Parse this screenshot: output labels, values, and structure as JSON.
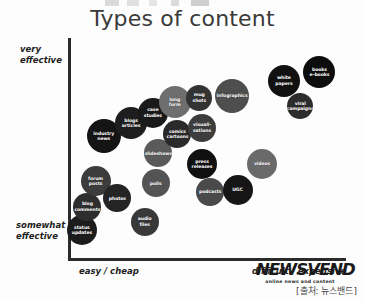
{
  "chart_data": {
    "type": "scatter",
    "title": "Types of content",
    "xlabel": "",
    "ylabel": "",
    "grid": false,
    "legend": "none",
    "axes": {
      "y_top_label": "very\neffective",
      "y_bottom_label": "somewhat\neffective",
      "x_left_label": "easy / cheap",
      "x_right_label": "difficult / expensive",
      "xlim": [
        0,
        100
      ],
      "ylim": [
        0,
        100
      ]
    },
    "points": [
      {
        "label": "status\nupdates",
        "x": 4,
        "y": 12,
        "size": 30,
        "color": "#1c1c1c"
      },
      {
        "label": "blog\ncomments",
        "x": 6,
        "y": 23,
        "size": 28,
        "color": "#2e2e2e"
      },
      {
        "label": "forum\nposts",
        "x": 9,
        "y": 35,
        "size": 30,
        "color": "#3c3c3c"
      },
      {
        "label": "photos",
        "x": 17,
        "y": 27,
        "size": 28,
        "color": "#242424"
      },
      {
        "label": "industry\nnews",
        "x": 12,
        "y": 56,
        "size": 34,
        "color": "#141414"
      },
      {
        "label": "blogs\narticles",
        "x": 22,
        "y": 62,
        "size": 32,
        "color": "#1e1e1e"
      },
      {
        "label": "audio\nfiles",
        "x": 27,
        "y": 16,
        "size": 28,
        "color": "#383838"
      },
      {
        "label": "polls",
        "x": 31,
        "y": 34,
        "size": 28,
        "color": "#545454"
      },
      {
        "label": "slideshows",
        "x": 32,
        "y": 48,
        "size": 28,
        "color": "#5a5a5a"
      },
      {
        "label": "case\nstudies",
        "x": 30,
        "y": 67,
        "size": 30,
        "color": "#1a1a1a"
      },
      {
        "label": "long\nform",
        "x": 38,
        "y": 72,
        "size": 32,
        "color": "#6e6e6e"
      },
      {
        "label": "comics\ncartoons",
        "x": 39,
        "y": 57,
        "size": 28,
        "color": "#2a2a2a"
      },
      {
        "label": "mug\nshots",
        "x": 47,
        "y": 74,
        "size": 26,
        "color": "#333333"
      },
      {
        "label": "visuali-\nsations",
        "x": 48,
        "y": 60,
        "size": 28,
        "color": "#3d3d3d"
      },
      {
        "label": "press\nreleases",
        "x": 48,
        "y": 43,
        "size": 30,
        "color": "#101010"
      },
      {
        "label": "podcasts",
        "x": 51,
        "y": 30,
        "size": 28,
        "color": "#4a4a4a"
      },
      {
        "label": "infographics",
        "x": 59,
        "y": 75,
        "size": 34,
        "color": "#4e4e4e"
      },
      {
        "label": "UGC",
        "x": 61,
        "y": 31,
        "size": 30,
        "color": "#161616"
      },
      {
        "label": "videos",
        "x": 70,
        "y": 43,
        "size": 30,
        "color": "#6a6a6a"
      },
      {
        "label": "white\npapers",
        "x": 78,
        "y": 82,
        "size": 32,
        "color": "#111111"
      },
      {
        "label": "viral\ncampaigns",
        "x": 84,
        "y": 70,
        "size": 26,
        "color": "#2c2c2c"
      },
      {
        "label": "books\ne-books",
        "x": 91,
        "y": 86,
        "size": 32,
        "color": "#0d0d0d"
      }
    ]
  },
  "logo": {
    "wordmark": "NEWSVEND",
    "tagline": "online news and content"
  },
  "footer": {
    "credit": "[출처: 뉴스밴드]"
  }
}
